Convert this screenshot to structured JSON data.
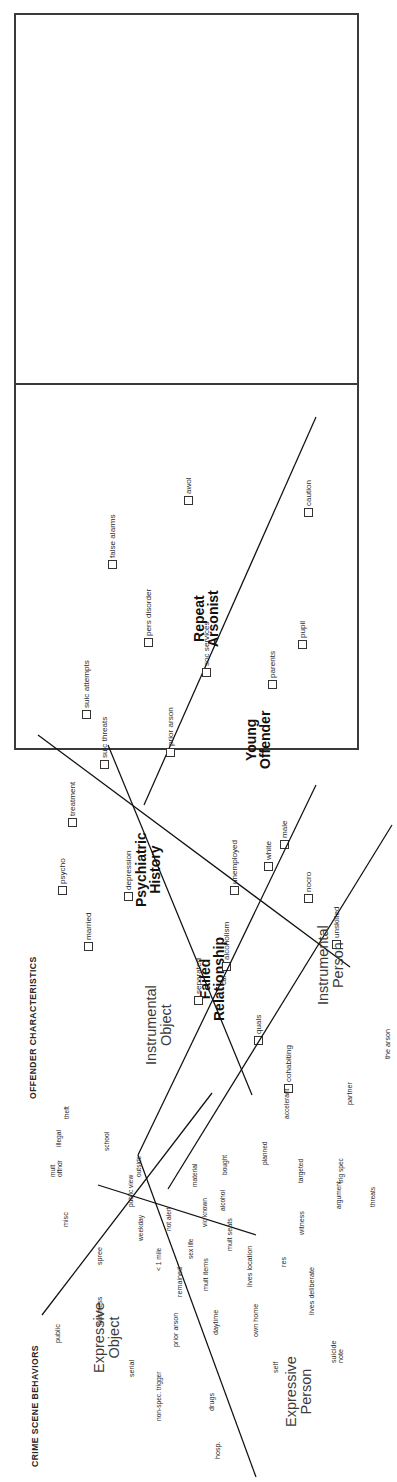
{
  "figure": {
    "orientation": "rotated-90-ccw",
    "panels": [
      {
        "id": "offender",
        "title": "OFFENDER CHARACTERISTICS",
        "regions": [
          {
            "name": "Failed\nRelationship"
          },
          {
            "name": "Psychiatric\nHistory"
          },
          {
            "name": "Young\nOffender"
          },
          {
            "name": "Repeat\nArsonist"
          }
        ],
        "points": [
          "cohabiting",
          "quals",
          "separated",
          "alcoholism",
          "married",
          "psycho",
          "depression",
          "treatment",
          "unskilled",
          "nocro",
          "unemployed",
          "white",
          "male",
          "suic threats",
          "prior arson",
          "suic attempts",
          "parents",
          "pupil",
          "soc services",
          "pers disorder",
          "false alarms",
          "awol",
          "caution"
        ]
      },
      {
        "id": "crime-scene",
        "title": "CRIME SCENE BEHAVIORS",
        "regions": [
          {
            "name": "Expressive\nObject"
          },
          {
            "name": "Expressive\nPerson"
          },
          {
            "name": "Instrumental\nObject"
          },
          {
            "name": "Instrumental\nPerson"
          }
        ],
        "points": [
          "hosp.",
          "non-spec. trigger",
          "drugs",
          "serial",
          "public",
          "business",
          "prior arson",
          "daytime",
          "remained",
          "mult items",
          "spree",
          "misc",
          "self",
          "own home",
          "suicide\nnote",
          "lives deliberate",
          "lives location",
          "res",
          "mult seats",
          "witness",
          "sex life",
          "< 1 mile",
          "weekday",
          "not alert",
          "vic known",
          "alcohol",
          "public view",
          "material",
          "outside",
          "school",
          "mult\noffndr",
          "illegal",
          "theft",
          "bought",
          "planned",
          "targeted",
          "trig spec",
          "argument",
          "threats",
          "accelerant",
          "car",
          "partner",
          "the arson"
        ]
      }
    ]
  }
}
